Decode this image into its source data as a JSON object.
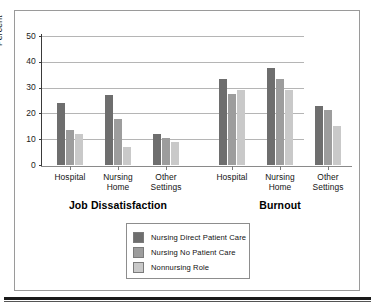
{
  "chart_data": {
    "type": "bar",
    "title": "",
    "xlabel": "",
    "ylabel": "Percent",
    "ylim": [
      0,
      50
    ],
    "yticks": [
      0,
      10,
      20,
      30,
      40,
      50
    ],
    "ytick_labels": [
      "0",
      "10",
      "20",
      "30",
      "40",
      "50"
    ],
    "grid": true,
    "grid_axis": "y",
    "legend_position": "bottom-center",
    "panels": [
      {
        "name": "Job Dissatisfaction",
        "categories": [
          "Hospital",
          "Nursing\nHome",
          "Other\nSettings"
        ],
        "series": [
          {
            "name": "Nursing Direct Patient Care",
            "values": [
              24,
              27,
              12
            ]
          },
          {
            "name": "Nursing No Patient Care",
            "values": [
              13.5,
              18,
              10.5
            ]
          },
          {
            "name": "Nonnursing Role",
            "values": [
              12,
              7,
              9
            ]
          }
        ]
      },
      {
        "name": "Burnout",
        "categories": [
          "Hospital",
          "Nursing\nHome",
          "Other\nSettings"
        ],
        "series": [
          {
            "name": "Nursing Direct Patient Care",
            "values": [
              33.5,
              37.5,
              23
            ]
          },
          {
            "name": "Nursing No Patient Care",
            "values": [
              27.5,
              33.5,
              21.5
            ]
          },
          {
            "name": "Nonnursing Role",
            "values": [
              29,
              29,
              15
            ]
          }
        ]
      }
    ],
    "legend": [
      {
        "label": "Nursing Direct Patient Care",
        "color": "#6e6e6e"
      },
      {
        "label": "Nursing No Patient Care",
        "color": "#9d9d9d"
      },
      {
        "label": "Nonnursing Role",
        "color": "#c9c9c9"
      }
    ],
    "colors": {
      "series_0": "#6e6e6e",
      "series_1": "#9d9d9d",
      "series_2": "#c9c9c9",
      "axis": "#3a3a3a",
      "grid": "#b5b5b5",
      "frame": "#9a9a9a",
      "text": "#111111"
    }
  }
}
